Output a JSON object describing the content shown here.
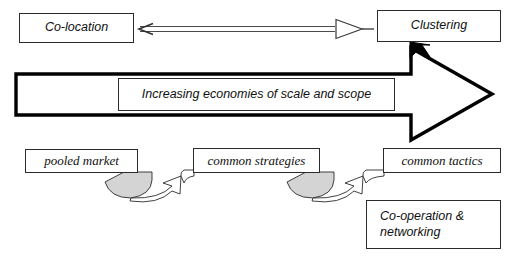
{
  "diagram": {
    "colors": {
      "stroke": "#2b2b2b",
      "heavy_stroke": "#000000",
      "wedge_fill": "#d4d4d4",
      "background": "#ffffff"
    },
    "top_row": {
      "source_box": {
        "label": "Co-location"
      },
      "connector": {
        "name": "thin-open-arrow",
        "direction": "left-to-right"
      },
      "target_box": {
        "label": "Clustering"
      }
    },
    "big_arrow": {
      "name": "block-arrow-right",
      "inner_label_box": {
        "label": "Increasing economies of scale and scope"
      }
    },
    "bottom_row": {
      "boxes": [
        {
          "label": "pooled market"
        },
        {
          "label": "common strategies"
        },
        {
          "label": "common tactics"
        }
      ],
      "connectors": [
        {
          "name": "curved-wedge-arrow",
          "from": "pooled market",
          "to": "common strategies"
        },
        {
          "name": "curved-wedge-arrow",
          "from": "common strategies",
          "to": "common tactics"
        }
      ]
    },
    "outcome_box": {
      "label": "Co-operation &\nnetworking"
    }
  }
}
